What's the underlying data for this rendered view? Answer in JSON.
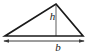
{
  "figure": {
    "name": "triangle-with-base-and-height",
    "type": "geometry-diagram",
    "shape": "triangle",
    "background_color": "#ffffff",
    "outline_color": "#1a1a1a",
    "height_line_color": "#9a9a9a",
    "dimension_line_color": "#3a3a3a",
    "label_color": "#1a1a1a",
    "labels": {
      "height": "h",
      "base": "b"
    },
    "geometry": {
      "apex": {
        "x": 56,
        "y": 4
      },
      "left_vertex": {
        "x": 5,
        "y": 36
      },
      "right_vertex": {
        "x": 83,
        "y": 36
      },
      "height_foot": {
        "x": 56,
        "y": 36
      },
      "dimension_line": {
        "x1": 4,
        "x2": 84,
        "y": 41
      }
    }
  }
}
